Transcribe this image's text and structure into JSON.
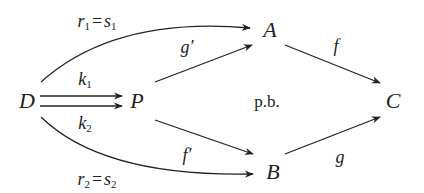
{
  "diagram": {
    "type": "commutative-diagram",
    "stroke_color": "#222222",
    "nodes": {
      "D": {
        "label": "D"
      },
      "P": {
        "label": "P"
      },
      "A": {
        "label": "A"
      },
      "B": {
        "label": "B"
      },
      "C": {
        "label": "C"
      }
    },
    "center_label": "p.b.",
    "arrows": {
      "r1": {
        "from": "D",
        "to": "A",
        "name": "r",
        "sub": "1",
        "eq_name": "s",
        "eq_sub": "1",
        "eq": "="
      },
      "r2": {
        "from": "D",
        "to": "B",
        "name": "r",
        "sub": "2",
        "eq_name": "s",
        "eq_sub": "2",
        "eq": "="
      },
      "k1": {
        "from": "D",
        "to": "P",
        "name": "k",
        "sub": "1"
      },
      "k2": {
        "from": "D",
        "to": "P",
        "name": "k",
        "sub": "2"
      },
      "g_prime": {
        "from": "P",
        "to": "A",
        "label": "g′"
      },
      "f_prime": {
        "from": "P",
        "to": "B",
        "label": "f′"
      },
      "f": {
        "from": "A",
        "to": "C",
        "label": "f"
      },
      "g": {
        "from": "B",
        "to": "C",
        "label": "g"
      }
    }
  }
}
